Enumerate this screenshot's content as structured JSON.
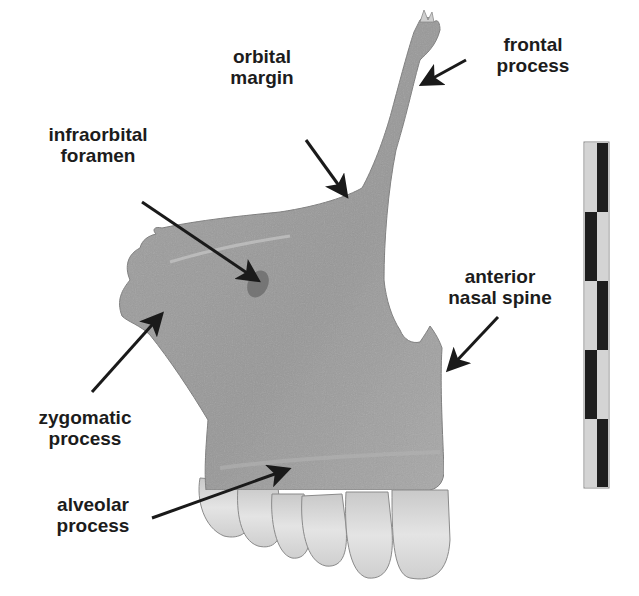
{
  "figure": {
    "background": "#ffffff",
    "bone_color": "#9c9c9c",
    "tooth_color": "#d8d8d8",
    "arrow_color": "#1a1a1a",
    "text_color": "#1c1c1c"
  },
  "labels": [
    {
      "id": "orbital-margin",
      "line1": "orbital",
      "line2": "margin"
    },
    {
      "id": "frontal-process",
      "line1": "frontal",
      "line2": "process"
    },
    {
      "id": "infraorbital-foramen",
      "line1": "infraorbital",
      "line2": "foramen"
    },
    {
      "id": "anterior-nasal-spine",
      "line1": "anterior",
      "line2": "nasal spine"
    },
    {
      "id": "zygomatic-process",
      "line1": "zygomatic",
      "line2": "process"
    },
    {
      "id": "alveolar-process",
      "line1": "alveolar",
      "line2": "process"
    }
  ],
  "scale_bar": {
    "segments": 5,
    "light_color": "#d4d4d4",
    "dark_color": "#1e1e1e"
  }
}
